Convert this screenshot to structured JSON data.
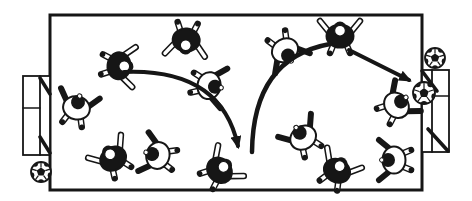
{
  "scene": {
    "description": "Black-and-white overhead illustration of a soccer play: two teams of top-view players on a pitch, a curved pass to midfield, a long lofted pass to a forward at the top line, and a shot arrow toward the ball at the right goal; loose balls sit at the bottom-left and top-right.",
    "background": "#ffffff",
    "ink": "#161616",
    "canvas": {
      "width": 472,
      "height": 201
    },
    "field": {
      "x": 50,
      "y": 15,
      "width": 372,
      "height": 175,
      "stroke_width": 3
    },
    "goals": [
      {
        "name": "left-goal",
        "side": "left",
        "lines": [
          {
            "rect": [
              23,
              76,
              27,
              79
            ],
            "w": 1.8
          },
          {
            "line": [
              40,
              76,
              40,
              155
            ],
            "w": 1.8
          },
          {
            "line": [
              23,
              108,
              40,
              108
            ],
            "w": 1.4
          },
          {
            "line": [
              40,
              78,
              50,
              94
            ],
            "w": 3.6
          },
          {
            "line": [
              40,
              137,
              50,
              153
            ],
            "w": 3.6
          }
        ]
      },
      {
        "name": "right-goal",
        "side": "right",
        "lines": [
          {
            "rect": [
              422,
              70,
              27,
              82
            ],
            "w": 1.8
          },
          {
            "line": [
              432,
              70,
              432,
              152
            ],
            "w": 1.8
          },
          {
            "line": [
              432,
              96,
              449,
              96
            ],
            "w": 1.4
          },
          {
            "line": [
              422,
              71,
              437,
              91
            ],
            "w": 3.6
          },
          {
            "line": [
              428,
              129,
              448,
              151
            ],
            "w": 3.6
          }
        ]
      }
    ],
    "players": [
      {
        "x": 121,
        "y": 66,
        "rot": 95,
        "team": "black",
        "role": "passer"
      },
      {
        "x": 186,
        "y": 42,
        "rot": 185,
        "team": "black"
      },
      {
        "x": 77,
        "y": 106,
        "rot": 15,
        "team": "white"
      },
      {
        "x": 112,
        "y": 157,
        "rot": 325,
        "team": "black"
      },
      {
        "x": 156,
        "y": 155,
        "rot": 285,
        "team": "white"
      },
      {
        "x": 211,
        "y": 86,
        "rot": 100,
        "team": "white"
      },
      {
        "x": 286,
        "y": 52,
        "rot": 150,
        "team": "white"
      },
      {
        "x": 340,
        "y": 34,
        "rot": 0,
        "team": "black",
        "role": "shooter"
      },
      {
        "x": 221,
        "y": 169,
        "rot": 50,
        "team": "black",
        "role": "receiver"
      },
      {
        "x": 302,
        "y": 136,
        "rot": 325,
        "team": "white"
      },
      {
        "x": 338,
        "y": 169,
        "rot": 30,
        "team": "black"
      },
      {
        "x": 392,
        "y": 160,
        "rot": 270,
        "team": "white"
      },
      {
        "x": 398,
        "y": 104,
        "rot": 50,
        "team": "white",
        "role": "goalkeeper"
      }
    ],
    "balls": [
      {
        "name": "ball-bottom-left",
        "cx": 41,
        "cy": 172,
        "r": 10
      },
      {
        "name": "ball-top-right",
        "cx": 435,
        "cy": 58,
        "r": 10
      },
      {
        "name": "ball-at-right-goal",
        "cx": 424,
        "cy": 93,
        "r": 11
      }
    ],
    "arrows": [
      {
        "name": "pass-arrow-1",
        "path": "M124,72 Q221,68 238,146",
        "width": 4,
        "arrowhead": true
      },
      {
        "name": "pass-arrow-2",
        "path": "M252,152 Q253,58 330,44",
        "width": 4.5,
        "arrowhead": false
      },
      {
        "name": "shot-arrow",
        "path": "M349,50 L409,80",
        "width": 4,
        "arrowhead": true
      }
    ]
  }
}
